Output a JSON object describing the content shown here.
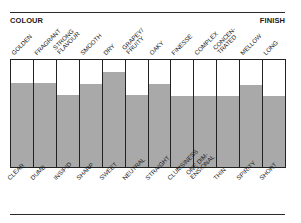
{
  "header": {
    "left_label": "COLOUR",
    "right_label": "FINISH"
  },
  "colors": {
    "fill": "#a9a9a9",
    "lines": "#222222",
    "background": "#ffffff"
  },
  "chart_data": {
    "type": "bar",
    "title": "",
    "categories_top": [
      [
        "GOLDEN"
      ],
      [
        "FRAGRANT"
      ],
      [
        "STRONG",
        "FLAVOUR"
      ],
      [
        "SMOOTH"
      ],
      [
        "DRY"
      ],
      [
        "GRAPEY/",
        "FRUITY"
      ],
      [
        "OAKY"
      ],
      [
        "FINESSE"
      ],
      [
        "COMPLEX"
      ],
      [
        "CONCEN-",
        "TRATED"
      ],
      [
        "MELLOW"
      ],
      [
        "LONG"
      ]
    ],
    "categories_bottom": [
      [
        "CLEAR"
      ],
      [
        "DUMB"
      ],
      [
        "INSIPID"
      ],
      [
        "SHARP"
      ],
      [
        "SWEET"
      ],
      [
        "NEUTRAL"
      ],
      [
        "STRAIGHT"
      ],
      [
        "CLUMSINESS"
      ],
      [
        "ONE DIM-",
        "ENSIONAL"
      ],
      [
        "THIN"
      ],
      [
        "SPIRITY"
      ],
      [
        "SHORT"
      ]
    ],
    "values": [
      78.5,
      78.5,
      67.3,
      77.6,
      88.8,
      67.3,
      77.6,
      66.4,
      66.4,
      66.4,
      76.6,
      66.4
    ],
    "ylim": [
      0,
      100
    ],
    "xlabel": "",
    "ylabel": "",
    "axis_labels": {
      "top_left": "COLOUR",
      "top_right": "FINISH"
    },
    "grid": false,
    "legend": null
  }
}
